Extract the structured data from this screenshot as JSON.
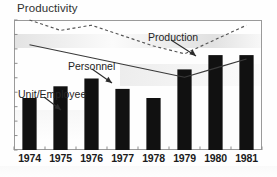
{
  "chart_data": {
    "type": "bar",
    "title": "Productivity",
    "xlabel": "",
    "ylabel": "",
    "categories": [
      "1974",
      "1975",
      "1976",
      "1977",
      "1978",
      "1979",
      "1980",
      "1981"
    ],
    "grid": false,
    "legend_position": "inline-annotations",
    "y_axis_ticks_labeled": false,
    "ylim": [
      0,
      100
    ],
    "series": [
      {
        "name": "Unit/Employee",
        "type": "bar",
        "color": "#111111",
        "values": [
          40,
          49,
          55,
          47,
          40,
          62,
          73,
          73
        ]
      },
      {
        "name": "Personnel",
        "type": "line",
        "style": "solid",
        "color": "#3a3a3a",
        "values": [
          81,
          76,
          71,
          66,
          61,
          56,
          63,
          70
        ]
      },
      {
        "name": "Production",
        "type": "line",
        "style": "dashed",
        "color": "#555555",
        "values": [
          100,
          92,
          96,
          88,
          80,
          74,
          85,
          96
        ]
      }
    ],
    "annotations": [
      {
        "label": "Production",
        "points_to": "Production series (dashed line)"
      },
      {
        "label": "Personnel",
        "points_to": "Personnel series (solid line)"
      },
      {
        "label": "Unit/Employee",
        "points_to": "1975 bar"
      }
    ]
  },
  "axis": {
    "x_ticks": [
      "1974",
      "1975",
      "1976",
      "1977",
      "1978",
      "1979",
      "1980",
      "1981"
    ]
  },
  "colors": {
    "bar": "#111111",
    "solid_line": "#3a3a3a",
    "dashed_line": "#555555",
    "frame": "#9a9a9a",
    "text": "#252525",
    "background": "#fefefe"
  }
}
